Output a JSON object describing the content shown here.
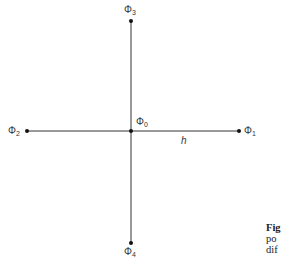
{
  "diagram": {
    "center": {
      "label": "Φ",
      "sub": "0"
    },
    "points": [
      {
        "id": "phi1",
        "label": "Φ",
        "sub": "1",
        "position": "right"
      },
      {
        "id": "phi2",
        "label": "Φ",
        "sub": "2",
        "position": "left"
      },
      {
        "id": "phi3",
        "label": "Φ",
        "sub": "3",
        "position": "top"
      },
      {
        "id": "phi4",
        "label": "Φ",
        "sub": "4",
        "position": "bottom"
      }
    ],
    "spacing_label": "h",
    "colors": {
      "line": "#333333",
      "dot": "#111111"
    }
  },
  "caption": {
    "line1": "Fig",
    "line2": "po",
    "line3": "dif"
  }
}
